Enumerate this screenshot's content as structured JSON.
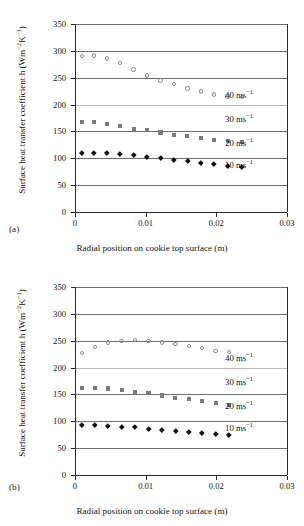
{
  "figure": {
    "panels": [
      {
        "tag": "(a)",
        "xlabel": "Radial position on cookie top surface (m)",
        "ylabel_main": "Surface heat transfer coefficient h (Wm",
        "ylabel_sup1": "−2",
        "ylabel_mid": "K",
        "ylabel_sup2": "−1",
        "ylabel_end": ")"
      },
      {
        "tag": "(b)",
        "xlabel": "Radial position on cookie top surface (m)",
        "ylabel_main": "Surface heat transfer coefficient h (Wm",
        "ylabel_sup1": "−2",
        "ylabel_mid": "K",
        "ylabel_sup2": "−1",
        "ylabel_end": ")"
      }
    ],
    "series_labels": [
      {
        "value": "40",
        "unit": "ms",
        "exponent": "−1"
      },
      {
        "value": "30",
        "unit": "ms",
        "exponent": "−1"
      },
      {
        "value": "20",
        "unit": "ms",
        "exponent": "−1"
      },
      {
        "value": "10",
        "unit": "ms",
        "exponent": "−1"
      }
    ]
  },
  "chart_data": [
    {
      "type": "scatter",
      "panel": "(a)",
      "title": "",
      "xlabel": "Radial position on cookie top surface (m)",
      "ylabel": "Surface heat transfer coefficient h (Wm−2K−1)",
      "xlim": [
        0,
        0.03
      ],
      "ylim": [
        0,
        350
      ],
      "xticks": [
        0,
        0.01,
        0.02,
        0.03
      ],
      "xticklabels": [
        "0",
        "0.01",
        "0.02",
        "0.03"
      ],
      "yticks": [
        0,
        50,
        100,
        150,
        200,
        250,
        300,
        350
      ],
      "yticklabels": [
        "0",
        "50",
        "100",
        "150",
        "200",
        "250",
        "300",
        "350"
      ],
      "grid": true,
      "legend": "inline-right-annotations",
      "series": [
        {
          "name": "40 ms−1",
          "marker": "open-circle",
          "color": "#8d8d8d",
          "x": [
            0.001,
            0.0027,
            0.0045,
            0.0064,
            0.0083,
            0.0102,
            0.0121,
            0.014,
            0.0159,
            0.0178,
            0.0197,
            0.0216,
            0.0236
          ],
          "y": [
            290,
            291,
            286,
            277,
            265,
            254,
            245,
            238,
            230,
            224,
            219,
            215,
            214
          ]
        },
        {
          "name": "30 ms−1",
          "marker": "faint-line",
          "color": "#b9b9b9",
          "x": [
            0.001,
            0.0236
          ],
          "y": [
            200,
            200
          ]
        },
        {
          "name": "20 ms−1",
          "marker": "filled-square",
          "color": "#7a7a7a",
          "x": [
            0.001,
            0.0027,
            0.0045,
            0.0064,
            0.0083,
            0.0102,
            0.0121,
            0.014,
            0.0159,
            0.0178,
            0.0197,
            0.0216,
            0.0236
          ],
          "y": [
            167,
            167,
            164,
            160,
            155,
            153,
            148,
            144,
            141,
            137,
            134,
            132,
            130
          ]
        },
        {
          "name": "10 ms−1",
          "marker": "filled-diamond",
          "color": "#111111",
          "x": [
            0.001,
            0.0027,
            0.0045,
            0.0064,
            0.0083,
            0.0102,
            0.0121,
            0.014,
            0.0159,
            0.0178,
            0.0197,
            0.0216,
            0.0236
          ],
          "y": [
            110,
            110,
            110,
            108,
            106,
            103,
            100,
            98,
            95,
            92,
            89,
            86,
            84
          ]
        }
      ]
    },
    {
      "type": "scatter",
      "panel": "(b)",
      "title": "",
      "xlabel": "Radial position on cookie top surface (m)",
      "ylabel": "Surface heat transfer coefficient h (Wm−2K−1)",
      "xlim": [
        0,
        0.03
      ],
      "ylim": [
        0,
        350
      ],
      "xticks": [
        0,
        0.01,
        0.02,
        0.03
      ],
      "xticklabels": [
        "0",
        "0.01",
        "0.02",
        "0.03"
      ],
      "yticks": [
        0,
        50,
        100,
        150,
        200,
        250,
        300,
        350
      ],
      "yticklabels": [
        "0",
        "50",
        "100",
        "150",
        "200",
        "250",
        "300",
        "350"
      ],
      "grid": true,
      "legend": "inline-right-annotations",
      "series": [
        {
          "name": "40 ms−1",
          "marker": "open-circle",
          "color": "#8d8d8d",
          "x": [
            0.001,
            0.0028,
            0.0047,
            0.0066,
            0.0085,
            0.0104,
            0.0123,
            0.0142,
            0.0161,
            0.018,
            0.0199,
            0.0218
          ],
          "y": [
            227,
            238,
            247,
            250,
            251,
            250,
            247,
            244,
            240,
            236,
            231,
            229
          ]
        },
        {
          "name": "30 ms−1",
          "marker": "faint-line",
          "color": "#b9b9b9",
          "x": [
            0.001,
            0.0218
          ],
          "y": [
            200,
            200
          ]
        },
        {
          "name": "20 ms−1",
          "marker": "filled-square",
          "color": "#7a7a7a",
          "x": [
            0.001,
            0.0028,
            0.0047,
            0.0066,
            0.0085,
            0.0104,
            0.0123,
            0.0142,
            0.0161,
            0.018,
            0.0199,
            0.0218
          ],
          "y": [
            162,
            162,
            161,
            158,
            155,
            152,
            148,
            144,
            141,
            138,
            134,
            131
          ]
        },
        {
          "name": "10 ms−1",
          "marker": "filled-diamond",
          "color": "#111111",
          "x": [
            0.001,
            0.0028,
            0.0047,
            0.0066,
            0.0085,
            0.0104,
            0.0123,
            0.0142,
            0.0161,
            0.018,
            0.0199,
            0.0218
          ],
          "y": [
            94,
            93,
            92,
            90,
            89,
            86,
            84,
            82,
            80,
            78,
            77,
            75
          ]
        }
      ]
    }
  ]
}
